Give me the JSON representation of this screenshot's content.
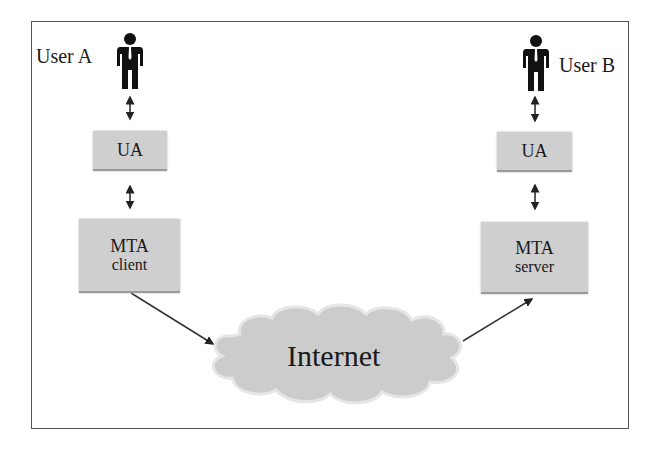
{
  "diagram": {
    "left": {
      "user_label": "User A",
      "ua_label": "UA",
      "mta_title": "MTA",
      "mta_sub": "client"
    },
    "right": {
      "user_label": "User B",
      "ua_label": "UA",
      "mta_title": "MTA",
      "mta_sub": "server"
    },
    "network_label": "Internet",
    "colors": {
      "box_fill": "#cfcfcf",
      "cloud_fill": "#cccccc",
      "border": "#555555",
      "text": "#1a1a1a"
    }
  }
}
